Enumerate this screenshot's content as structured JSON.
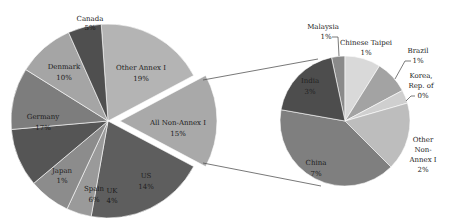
{
  "chart_data": [
    {
      "type": "pie",
      "title": "",
      "name": "Annex I breakdown (bar-of-pie main)",
      "labels": [
        "Other Annex I",
        "All Non-Annex I",
        "US",
        "UK",
        "Spain",
        "Japan",
        "Germany",
        "Denmark",
        "Canada"
      ],
      "values": [
        19,
        15,
        14,
        4,
        6,
        1,
        17,
        10,
        5
      ],
      "value_labels": [
        "19%",
        "15%",
        "14%",
        "4%",
        "6%",
        "1%",
        "17%",
        "10%",
        "5%"
      ],
      "exploded": "All Non-Annex I",
      "colors": [
        "#b4b4b4",
        "#a9a9a9",
        "#5e5e5e",
        "#9a9a9a",
        "#8c8c8c",
        "#555555",
        "#7d7d7d",
        "#a5a5a5",
        "#4f4f4f"
      ],
      "angles_deg": [
        [
          -4,
          62
        ],
        [
          62,
          118
        ],
        [
          118,
          190
        ],
        [
          190,
          205
        ],
        [
          205,
          230
        ],
        [
          230,
          265
        ],
        [
          265,
          302
        ],
        [
          302,
          336
        ],
        [
          336,
          356
        ]
      ]
    },
    {
      "type": "pie",
      "title": "",
      "name": "All Non-Annex I breakdown (secondary pie)",
      "labels": [
        "Malaysia",
        "Chinese Taipei",
        "Brazil",
        "Korea, Rep. of",
        "Other Non-Annex I",
        "China",
        "India"
      ],
      "values": [
        1,
        1,
        1,
        0,
        2,
        7,
        3
      ],
      "value_labels": [
        "1%",
        "1%",
        "1%",
        "0%",
        "2%",
        "7%",
        "3%"
      ],
      "colors": [
        "#8a8a8a",
        "#d9d9d9",
        "#a3a3a3",
        "#cfcfcf",
        "#bdbdbd",
        "#7f7f7f",
        "#4d4d4d"
      ],
      "angles_deg": [
        [
          -12,
          0
        ],
        [
          0,
          32
        ],
        [
          32,
          62
        ],
        [
          62,
          74
        ],
        [
          74,
          135
        ],
        [
          135,
          280
        ],
        [
          280,
          348
        ]
      ]
    }
  ],
  "labels": {
    "canada": {
      "name": "Canada",
      "pct": "5%"
    },
    "denmark": {
      "name": "Denmark",
      "pct": "10%"
    },
    "other_annex": {
      "name": "Other Annex I",
      "pct": "19%"
    },
    "germany": {
      "name": "Germany",
      "pct": "17%"
    },
    "non_annex": {
      "name": "All Non-Annex I",
      "pct": "15%"
    },
    "japan": {
      "name": "Japan",
      "pct": "1%"
    },
    "spain": {
      "name": "Spain",
      "pct": "6%"
    },
    "uk": {
      "name": "UK",
      "pct": "4%"
    },
    "us": {
      "name": "US",
      "pct": "14%"
    },
    "malaysia": {
      "name": "Malaysia",
      "pct": "1%"
    },
    "taipei": {
      "name": "Chinese Taipei",
      "pct": "1%"
    },
    "brazil": {
      "name": "Brazil",
      "pct": "1%"
    },
    "korea": {
      "name1": "Korea,",
      "name2": "Rep. of",
      "pct": "0%"
    },
    "india": {
      "name": "India",
      "pct": "3%"
    },
    "china": {
      "name": "China",
      "pct": "7%"
    },
    "other_non": {
      "name1": "Other",
      "name2": "Non-",
      "name3": "Annex I",
      "pct": "2%"
    }
  }
}
